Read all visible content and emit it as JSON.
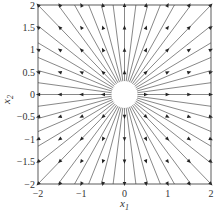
{
  "figure": {
    "type": "phase_portrait",
    "xlabel": "x",
    "xlabel_sub": "1",
    "ylabel": "x",
    "ylabel_sub": "2",
    "xlim": [
      -2,
      2
    ],
    "ylim": [
      -2,
      2
    ],
    "xticks": [
      "-2",
      "-1",
      "0",
      "1",
      "2"
    ],
    "yticks": [
      "2",
      "1.5",
      "1",
      "0.5",
      "0",
      "-0.5",
      "-1",
      "-1.5",
      "-2"
    ],
    "colors": {
      "line": "#555555",
      "arrow": "#222222",
      "frame": "#333333",
      "text": "#333333"
    }
  }
}
